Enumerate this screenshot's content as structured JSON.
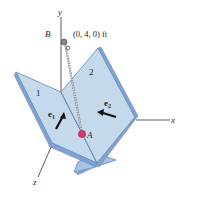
{
  "diagram": {
    "axes": {
      "x": "x",
      "y": "y",
      "z": "z"
    },
    "point_B": {
      "label": "B",
      "coords": "(0, 4, 0) ft"
    },
    "point_A": {
      "label": "A"
    },
    "panels": [
      {
        "label": "1",
        "unit_vector": "e",
        "unit_vector_sub": "1"
      },
      {
        "label": "2",
        "unit_vector": "e",
        "unit_vector_sub": "2"
      }
    ],
    "colors": {
      "panel_face": "#c5d9ec",
      "panel_edge": "#7fa2cf",
      "panel_edge_dark": "#5f86bb",
      "point_A": "#e0356a",
      "line": "#333333"
    }
  }
}
